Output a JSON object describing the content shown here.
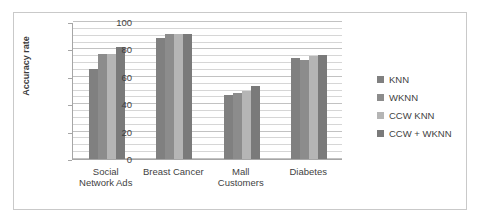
{
  "chart_data": {
    "type": "bar",
    "title": "",
    "xlabel": "",
    "ylabel": "Accuracy rate",
    "ylim": [
      0,
      100
    ],
    "yticks": [
      0,
      20,
      40,
      60,
      80,
      100
    ],
    "ytick_labels": [
      "0",
      "20",
      "40",
      "60",
      "80",
      "100"
    ],
    "minor_gridlines": true,
    "minor_tick_step": 5,
    "grid": true,
    "legend_position": "right",
    "categories": [
      "Social\nNetwork Ads",
      "Breast Cancer",
      "Mall\nCustomers",
      "Diabetes"
    ],
    "series": [
      {
        "name": "KNN",
        "color": "#808080",
        "values": [
          66,
          88,
          47,
          74
        ]
      },
      {
        "name": "WKNN",
        "color": "#8c8c8c",
        "values": [
          77,
          91,
          48.5,
          72.5
        ]
      },
      {
        "name": "CCW KNN",
        "color": "#b5b5b5",
        "values": [
          76.5,
          91,
          50,
          75
        ]
      },
      {
        "name": "CCW + WKNN",
        "color": "#7a7a7a",
        "values": [
          82,
          91,
          53,
          76
        ]
      }
    ]
  },
  "legend": {
    "items": [
      {
        "label": "KNN"
      },
      {
        "label": "WKNN"
      },
      {
        "label": "CCW KNN"
      },
      {
        "label": "CCW + WKNN"
      }
    ]
  },
  "axis": {
    "y_title": "Accuracy rate"
  }
}
